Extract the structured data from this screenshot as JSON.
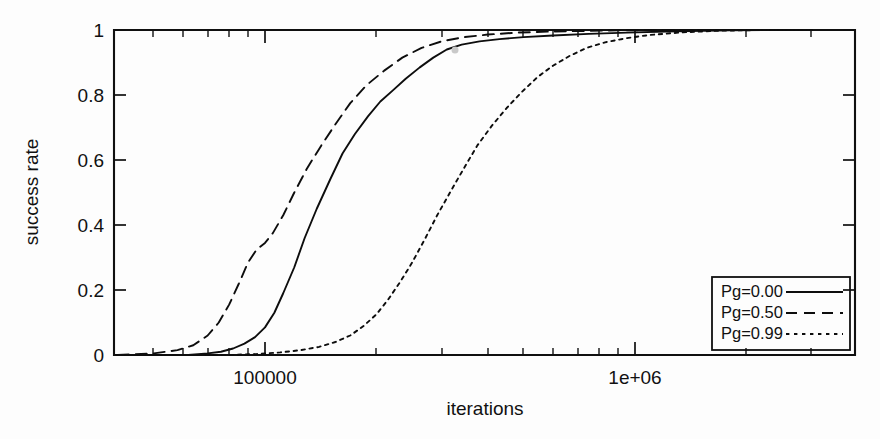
{
  "chart_data": {
    "type": "line",
    "title": "",
    "xlabel": "iterations",
    "ylabel": "success rate",
    "xscale": "log",
    "yscale": "linear",
    "xlim": [
      40000,
      3000000
    ],
    "ylim": [
      0,
      1
    ],
    "grid": false,
    "legend_position": "bottom-right",
    "xticks": [
      {
        "value": 100000,
        "label": "100000"
      },
      {
        "value": 1000000,
        "label": "1e+06"
      }
    ],
    "yticks": [
      {
        "value": 0,
        "label": "0"
      },
      {
        "value": 0.2,
        "label": "0.2"
      },
      {
        "value": 0.4,
        "label": "0.4"
      },
      {
        "value": 0.6,
        "label": "0.6"
      },
      {
        "value": 0.8,
        "label": "0.8"
      },
      {
        "value": 1,
        "label": "1"
      }
    ],
    "series": [
      {
        "name": "Pg=0.00",
        "style": "solid",
        "color": "#0d0d0d",
        "x": [
          40000,
          52000,
          62000,
          70000,
          76000,
          82000,
          88000,
          94000,
          100000,
          106000,
          112000,
          120000,
          128000,
          138000,
          150000,
          162000,
          175000,
          190000,
          205000,
          222000,
          240000,
          262000,
          285000,
          310000,
          340000,
          380000,
          430000,
          500000,
          600000,
          750000,
          950000,
          1300000,
          1800000,
          2400000,
          3000000
        ],
        "y": [
          0.0,
          0.0,
          0.0,
          0.005,
          0.01,
          0.02,
          0.035,
          0.055,
          0.085,
          0.13,
          0.19,
          0.27,
          0.36,
          0.45,
          0.54,
          0.62,
          0.68,
          0.735,
          0.78,
          0.815,
          0.85,
          0.885,
          0.915,
          0.94,
          0.955,
          0.965,
          0.972,
          0.978,
          0.983,
          0.988,
          0.992,
          0.996,
          0.999,
          1.0,
          1.0
        ]
      },
      {
        "name": "Pg=0.50",
        "style": "dashed",
        "color": "#0d0d0d",
        "x": [
          40000,
          50000,
          58000,
          64000,
          70000,
          75000,
          80000,
          85000,
          90000,
          95000,
          100000,
          105000,
          112000,
          120000,
          130000,
          142000,
          155000,
          170000,
          188000,
          210000,
          235000,
          265000,
          300000,
          345000,
          400000,
          480000,
          580000,
          720000,
          900000,
          1200000,
          1700000,
          2300000,
          3000000
        ],
        "y": [
          0.0,
          0.005,
          0.015,
          0.03,
          0.06,
          0.1,
          0.155,
          0.22,
          0.285,
          0.325,
          0.345,
          0.375,
          0.43,
          0.5,
          0.575,
          0.645,
          0.71,
          0.775,
          0.83,
          0.875,
          0.915,
          0.945,
          0.965,
          0.978,
          0.986,
          0.992,
          0.995,
          0.997,
          0.999,
          1.0,
          1.0,
          1.0,
          1.0
        ]
      },
      {
        "name": "Pg=0.99",
        "style": "dotted",
        "color": "#0d0d0d",
        "x": [
          40000,
          60000,
          80000,
          95000,
          110000,
          125000,
          140000,
          155000,
          170000,
          185000,
          200000,
          215000,
          232000,
          250000,
          270000,
          292000,
          318000,
          345000,
          375000,
          410000,
          450000,
          495000,
          545000,
          600000,
          665000,
          740000,
          830000,
          950000,
          1100000,
          1350000,
          1700000,
          2200000,
          3000000
        ],
        "y": [
          0.0,
          0.0,
          0.0,
          0.003,
          0.008,
          0.015,
          0.025,
          0.04,
          0.06,
          0.09,
          0.125,
          0.17,
          0.225,
          0.285,
          0.355,
          0.43,
          0.505,
          0.575,
          0.645,
          0.705,
          0.76,
          0.81,
          0.855,
          0.89,
          0.92,
          0.945,
          0.962,
          0.975,
          0.985,
          0.993,
          0.998,
          1.0,
          1.0
        ]
      }
    ],
    "annotations": []
  },
  "axes": {
    "y_axis_title": "success rate",
    "x_axis_title": "iterations",
    "y_tick_labels": [
      "1",
      "0.8",
      "0.6",
      "0.4",
      "0.2",
      "0"
    ],
    "x_tick_labels": [
      "100000",
      "1e+06"
    ]
  },
  "legend": {
    "entries": [
      {
        "label": "Pg=0.00",
        "style": "solid"
      },
      {
        "label": "Pg=0.50",
        "style": "dashed"
      },
      {
        "label": "Pg=0.99",
        "style": "dotted"
      }
    ]
  }
}
